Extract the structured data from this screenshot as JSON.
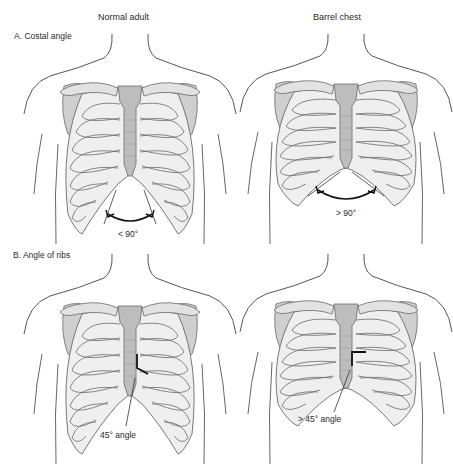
{
  "columns": [
    {
      "title": "Normal adult"
    },
    {
      "title": "Barrel chest"
    }
  ],
  "sections": [
    {
      "label": "A. Costal angle",
      "panels": [
        {
          "variant": "normal",
          "annotation": "< 90°",
          "indicator": "costal-angle-arc"
        },
        {
          "variant": "barrel",
          "annotation": "> 90°",
          "indicator": "costal-angle-arc"
        }
      ]
    },
    {
      "label": "B. Angle of ribs",
      "panels": [
        {
          "variant": "normal",
          "annotation": "45° angle",
          "indicator": "rib-angle-marker"
        },
        {
          "variant": "barrel",
          "annotation": "> 45° angle",
          "indicator": "rib-angle-marker"
        }
      ]
    }
  ],
  "colors": {
    "bone_fill": "#e2e2e2",
    "bone_shade": "#c8c8c8",
    "sternum_fill": "#bdbdbd",
    "outline": "#6a6a6a",
    "body_outline": "#555555",
    "indicator": "#111111",
    "background": "#ffffff"
  }
}
